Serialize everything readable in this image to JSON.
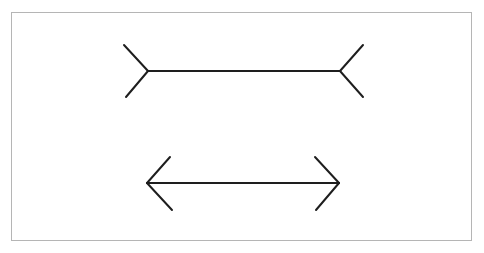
{
  "diagram": {
    "stroke_color": "#1e1e1e",
    "border_color": "#b5b5b5",
    "background": "#ffffff",
    "figures": [
      {
        "name": "fins-out",
        "shaft": {
          "x1": 148,
          "y1": 71,
          "x2": 340,
          "y2": 71
        },
        "left_fins": [
          [
            124,
            45,
            148,
            71
          ],
          [
            126,
            97,
            148,
            71
          ]
        ],
        "right_fins": [
          [
            363,
            45,
            340,
            71
          ],
          [
            363,
            97,
            340,
            71
          ]
        ]
      },
      {
        "name": "fins-in",
        "shaft": {
          "x1": 147,
          "y1": 183,
          "x2": 339,
          "y2": 183
        },
        "left_fins": [
          [
            170,
            157,
            147,
            183
          ],
          [
            172,
            210,
            147,
            183
          ]
        ],
        "right_fins": [
          [
            315,
            157,
            339,
            183
          ],
          [
            316,
            210,
            339,
            183
          ]
        ]
      }
    ]
  }
}
